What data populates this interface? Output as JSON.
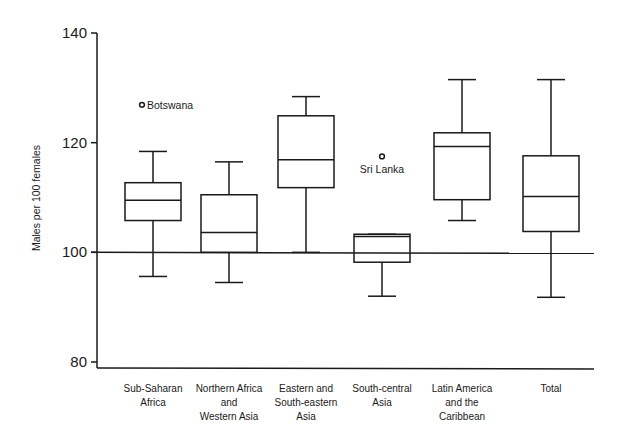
{
  "chart_data": {
    "type": "boxplot",
    "title": "",
    "xlabel": "",
    "ylabel": "Males per 100 females",
    "ylim": [
      80,
      140
    ],
    "yticks": [
      80,
      100,
      120,
      140
    ],
    "reference_line": 100,
    "grid": false,
    "categories": [
      [
        "Sub-Saharan",
        "Africa"
      ],
      [
        "Northern Africa",
        "and",
        "Western Asia"
      ],
      [
        "Eastern and",
        "South-eastern",
        "Asia"
      ],
      [
        "South-central",
        "Asia"
      ],
      [
        "Latin America",
        "and the",
        "Caribbean"
      ],
      [
        "Total"
      ]
    ],
    "series": [
      {
        "name": "Sub-Saharan Africa",
        "whisker_low": 95.6,
        "q1": 105.8,
        "median": 109.5,
        "q3": 112.7,
        "whisker_high": 118.4,
        "outliers": [
          {
            "label": "Botswana",
            "value": 126.9,
            "label_pos": "right"
          }
        ]
      },
      {
        "name": "Northern Africa and Western Asia",
        "whisker_low": 94.5,
        "q1": 100.0,
        "median": 103.6,
        "q3": 110.5,
        "whisker_high": 116.5,
        "outliers": []
      },
      {
        "name": "Eastern and South-eastern Asia",
        "whisker_low": 100.0,
        "q1": 111.8,
        "median": 116.9,
        "q3": 124.9,
        "whisker_high": 128.4,
        "outliers": []
      },
      {
        "name": "South-central Asia",
        "whisker_low": 92.0,
        "q1": 98.2,
        "median": 102.9,
        "q3": 103.3,
        "whisker_high": 103.3,
        "outliers": [
          {
            "label": "Sri Lanka",
            "value": 117.5,
            "label_pos": "below"
          }
        ]
      },
      {
        "name": "Latin America and the Caribbean",
        "whisker_low": 105.8,
        "q1": 109.6,
        "median": 119.3,
        "q3": 121.8,
        "whisker_high": 131.5,
        "outliers": []
      },
      {
        "name": "Total",
        "whisker_low": 91.8,
        "q1": 103.8,
        "median": 110.2,
        "q3": 117.6,
        "whisker_high": 131.5,
        "outliers": []
      }
    ]
  },
  "layout": {
    "plot_left": 97,
    "plot_right": 594,
    "y_top_px": 33,
    "y_bottom_px": 362,
    "box_centers": [
      153,
      229,
      306,
      382,
      462,
      551
    ],
    "box_width": 56,
    "cap_width": 28
  }
}
